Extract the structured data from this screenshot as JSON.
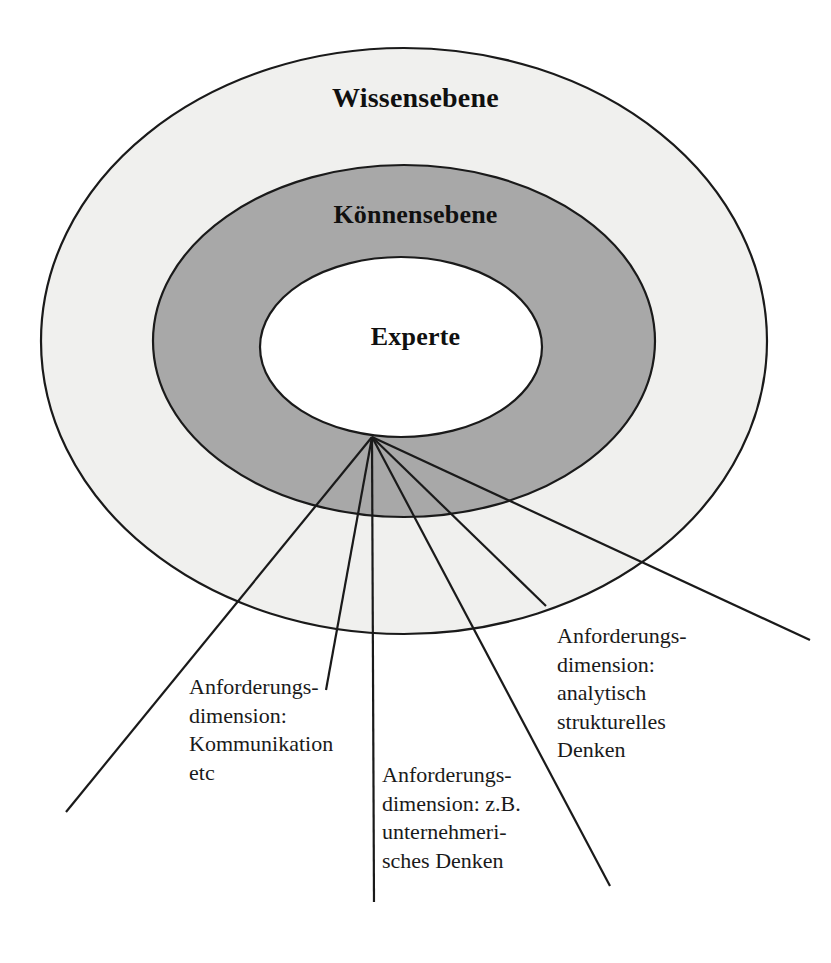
{
  "diagram": {
    "background_color": "#ffffff",
    "rings": [
      {
        "id": "wissensebene",
        "label": "Wissensebene",
        "fill_color": "#f0f0ee",
        "stroke_color": "#1a1a1a"
      },
      {
        "id": "koennensebene",
        "label": "Könnensebene",
        "fill_color": "#a8a8a8",
        "stroke_color": "#1a1a1a"
      },
      {
        "id": "experte",
        "label": "Experte",
        "fill_color": "#ffffff",
        "stroke_color": "#1a1a1a"
      }
    ],
    "callouts": [
      {
        "id": "kommunikation",
        "text": "Anforderungs-\ndimension:\nKommunikation\netc"
      },
      {
        "id": "unternehmerisch",
        "text": "Anforderungs-\ndimension: z.B.\nunternehmeri-\nsches Denken"
      },
      {
        "id": "analytisch",
        "text": "Anforderungs-\ndimension:\nanalytisch\nstrukturelles\nDenken"
      }
    ],
    "line_color": "#1a1a1a"
  }
}
